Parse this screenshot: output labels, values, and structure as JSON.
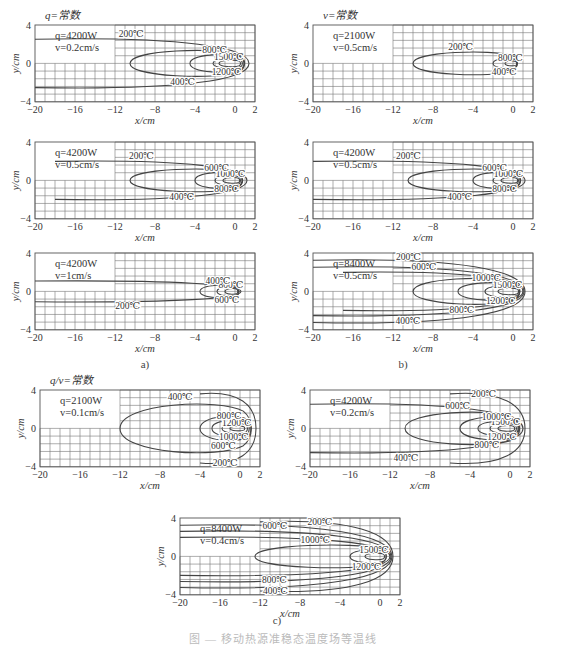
{
  "figure": {
    "sub_labels": {
      "a": "a)",
      "b": "b)",
      "c": "c)"
    },
    "caption": "图 — 移动热源准稳态温度场等温线",
    "group_titles": {
      "a": "q=常数",
      "b": "v=常数",
      "c": "q/v=常数"
    }
  },
  "axes_common": {
    "xlabel": "x/cm",
    "ylabel": "y/cm",
    "xticks": [
      -20,
      -16,
      -12,
      -8,
      -4,
      0,
      2
    ],
    "yticks": [
      4,
      0,
      -4
    ],
    "xlim": [
      -20,
      2
    ],
    "ylim": [
      -4,
      4
    ]
  },
  "chart_data": [
    {
      "id": "a1",
      "type": "line",
      "group": "a",
      "title": "q=常数",
      "params": {
        "q": "q=4200W",
        "v": "v=0.2cm/s"
      },
      "xlabel": "x/cm",
      "ylabel": "y/cm",
      "xlim": [
        -20,
        2
      ],
      "ylim": [
        -4,
        4
      ],
      "isotherms": [
        {
          "T": "1500℃",
          "x_min": -1.6,
          "x_max": 0.6,
          "half_width": 0.4
        },
        {
          "T": "1200℃",
          "x_min": -2.2,
          "x_max": 0.8,
          "half_width": 0.6
        },
        {
          "T": "800℃",
          "x_min": -4.5,
          "x_max": 1.0,
          "half_width": 1.1
        },
        {
          "T": "400℃",
          "x_min": -10.5,
          "x_max": 1.2,
          "half_width": 1.6
        },
        {
          "T": "200℃",
          "x_min": -20,
          "x_max": 1.4,
          "half_width": 2.8,
          "open": true
        }
      ],
      "annotations": [
        "1200℃",
        "1500℃",
        "800℃",
        "400℃",
        "200℃"
      ]
    },
    {
      "id": "a2",
      "type": "line",
      "group": "a",
      "params": {
        "q": "q=4200W",
        "v": "v=0.5cm/s"
      },
      "xlabel": "x/cm",
      "ylabel": "y/cm",
      "xlim": [
        -20,
        2
      ],
      "ylim": [
        -4,
        4
      ],
      "isotherms": [
        {
          "T": "1000℃",
          "x_min": -1.2,
          "x_max": 0.5,
          "half_width": 0.35
        },
        {
          "T": "800℃",
          "x_min": -2.0,
          "x_max": 0.6,
          "half_width": 0.6
        },
        {
          "T": "600℃",
          "x_min": -4.0,
          "x_max": 0.8,
          "half_width": 1.0
        },
        {
          "T": "400℃",
          "x_min": -10.5,
          "x_max": 1.0,
          "half_width": 1.4
        },
        {
          "T": "200℃",
          "x_min": -18,
          "x_max": 1.2,
          "half_width": 2.2,
          "open": true
        }
      ],
      "annotations": [
        "800℃",
        "1000℃",
        "400℃",
        "200℃",
        "600℃"
      ]
    },
    {
      "id": "a3",
      "type": "line",
      "group": "a",
      "params": {
        "q": "q=4200W",
        "v": "v=1cm/s"
      },
      "xlabel": "x/cm",
      "ylabel": "y/cm",
      "xlim": [
        -20,
        2
      ],
      "ylim": [
        -4,
        4
      ],
      "isotherms": [
        {
          "T": "800℃",
          "x_min": -1.0,
          "x_max": 0.3,
          "half_width": 0.35
        },
        {
          "T": "600℃",
          "x_min": -1.8,
          "x_max": 0.4,
          "half_width": 0.55
        },
        {
          "T": "400℃",
          "x_min": -3.5,
          "x_max": 0.5,
          "half_width": 0.8
        },
        {
          "T": "200℃",
          "x_min": -20,
          "x_max": 0.6,
          "half_width": 1.2,
          "open": true
        }
      ],
      "annotations": [
        "800℃",
        "600℃",
        "400℃",
        "200℃"
      ]
    },
    {
      "id": "b1",
      "type": "line",
      "group": "b",
      "title": "v=常数",
      "params": {
        "q": "q=2100W",
        "v": "v=0.5cm/s"
      },
      "xlabel": "x/cm",
      "ylabel": "y/cm",
      "xlim": [
        -20,
        2
      ],
      "ylim": [
        -4,
        4
      ],
      "isotherms": [
        {
          "T": "800℃",
          "x_min": -0.8,
          "x_max": 0.4,
          "half_width": 0.3
        },
        {
          "T": "400℃",
          "x_min": -2.0,
          "x_max": 0.5,
          "half_width": 0.6
        },
        {
          "T": "200℃",
          "x_min": -10.0,
          "x_max": 0.6,
          "half_width": 1.4
        }
      ],
      "annotations": [
        "400℃",
        "800℃",
        "200℃"
      ]
    },
    {
      "id": "b2",
      "type": "line",
      "group": "b",
      "params": {
        "q": "q=4200W",
        "v": "v=0.5cm/s"
      },
      "xlabel": "x/cm",
      "ylabel": "y/cm",
      "xlim": [
        -20,
        2
      ],
      "ylim": [
        -4,
        4
      ],
      "isotherms": [
        {
          "T": "1000℃",
          "x_min": -1.2,
          "x_max": 0.5,
          "half_width": 0.35
        },
        {
          "T": "800℃",
          "x_min": -2.0,
          "x_max": 0.6,
          "half_width": 0.6
        },
        {
          "T": "600℃",
          "x_min": -4.0,
          "x_max": 0.8,
          "half_width": 1.0
        },
        {
          "T": "400℃",
          "x_min": -10.5,
          "x_max": 1.0,
          "half_width": 1.4
        },
        {
          "T": "200℃",
          "x_min": -20,
          "x_max": 1.2,
          "half_width": 2.2,
          "open": true
        }
      ],
      "annotations": [
        "600℃",
        "800℃",
        "1000℃",
        "400℃",
        "200℃"
      ]
    },
    {
      "id": "b3",
      "type": "line",
      "group": "b",
      "params": {
        "q": "q=8400W",
        "v": "v=0.5cm/s"
      },
      "xlabel": "x/cm",
      "ylabel": "y/cm",
      "xlim": [
        -20,
        2
      ],
      "ylim": [
        -4,
        4
      ],
      "isotherms": [
        {
          "T": "1500℃",
          "x_min": -1.5,
          "x_max": 0.6,
          "half_width": 0.4
        },
        {
          "T": "1200℃",
          "x_min": -2.8,
          "x_max": 0.7,
          "half_width": 0.7
        },
        {
          "T": "1000℃",
          "x_min": -5.5,
          "x_max": 0.8,
          "half_width": 1.1
        },
        {
          "T": "800℃",
          "x_min": -10.0,
          "x_max": 0.9,
          "half_width": 1.6
        },
        {
          "T": "600℃",
          "x_min": -17.0,
          "x_max": 1.0,
          "half_width": 2.2,
          "open": true
        },
        {
          "T": "400℃",
          "x_min": -20,
          "x_max": 1.1,
          "half_width": 2.8,
          "open": true
        },
        {
          "T": "200℃",
          "x_min": -20,
          "x_max": 1.2,
          "half_width": 3.6,
          "open": true
        }
      ],
      "annotations": [
        "1000℃",
        "1200℃",
        "1500℃",
        "600℃",
        "800℃",
        "400℃",
        "200℃"
      ]
    },
    {
      "id": "c1",
      "type": "line",
      "group": "c",
      "title": "q/v=常数",
      "params": {
        "q": "q=2100W",
        "v": "v=0.1cm/s"
      },
      "xlabel": "x/cm",
      "ylabel": "y/cm",
      "xlim": [
        -20,
        2
      ],
      "ylim": [
        -4,
        4
      ],
      "isotherms": [
        {
          "T": "1200℃",
          "x_min": -1.0,
          "x_max": 0.5,
          "half_width": 0.3
        },
        {
          "T": "1000℃",
          "x_min": -1.8,
          "x_max": 0.8,
          "half_width": 0.6
        },
        {
          "T": "800℃",
          "x_min": -2.8,
          "x_max": 1.0,
          "half_width": 1.0
        },
        {
          "T": "600℃",
          "x_min": -4.0,
          "x_max": 1.2,
          "half_width": 1.5
        },
        {
          "T": "400℃",
          "x_min": -12.0,
          "x_max": 1.4,
          "half_width": 3.0
        },
        {
          "T": "200℃",
          "x_min": -4.0,
          "x_max": 1.6,
          "half_width": 4.0,
          "open": true
        }
      ],
      "annotations": [
        "800℃",
        "1000℃",
        "1200℃",
        "600℃",
        "400℃",
        "200℃"
      ]
    },
    {
      "id": "c2",
      "type": "line",
      "group": "c",
      "params": {
        "q": "q=4200W",
        "v": "v=0.2cm/s"
      },
      "xlabel": "x/cm",
      "ylabel": "y/cm",
      "xlim": [
        -20,
        2
      ],
      "ylim": [
        -4,
        4
      ],
      "isotherms": [
        {
          "T": "1500℃",
          "x_min": -1.2,
          "x_max": 0.5,
          "half_width": 0.35
        },
        {
          "T": "1200℃",
          "x_min": -2.0,
          "x_max": 0.7,
          "half_width": 0.6
        },
        {
          "T": "1000℃",
          "x_min": -3.2,
          "x_max": 0.9,
          "half_width": 0.9
        },
        {
          "T": "800℃",
          "x_min": -5.0,
          "x_max": 1.0,
          "half_width": 1.4
        },
        {
          "T": "600℃",
          "x_min": -10.5,
          "x_max": 1.2,
          "half_width": 2.0
        },
        {
          "T": "400℃",
          "x_min": -20,
          "x_max": 1.3,
          "half_width": 2.8,
          "open": true
        },
        {
          "T": "200℃",
          "x_min": -6.0,
          "x_max": 1.5,
          "half_width": 4.0,
          "open": true
        }
      ],
      "annotations": [
        "1000℃",
        "1200℃",
        "1500℃",
        "800℃",
        "600℃",
        "400℃",
        "200℃"
      ]
    },
    {
      "id": "c3",
      "type": "line",
      "group": "c",
      "params": {
        "q": "q=8400W",
        "v": "v=0.4cm/s"
      },
      "xlabel": "x/cm",
      "ylabel": "y/cm",
      "xlim": [
        -20,
        2
      ],
      "ylim": [
        -4,
        4
      ],
      "isotherms": [
        {
          "T": "1500℃",
          "x_min": -1.5,
          "x_max": 0.5,
          "half_width": 0.4
        },
        {
          "T": "1200℃",
          "x_min": -3.0,
          "x_max": 0.7,
          "half_width": 0.8
        },
        {
          "T": "1000℃",
          "x_min": -12.5,
          "x_max": 0.9,
          "half_width": 1.4
        },
        {
          "T": "800℃",
          "x_min": -20,
          "x_max": 1.0,
          "half_width": 2.2,
          "open": true
        },
        {
          "T": "600℃",
          "x_min": -20,
          "x_max": 1.1,
          "half_width": 2.9,
          "open": true
        },
        {
          "T": "400℃",
          "x_min": -20,
          "x_max": 1.2,
          "half_width": 3.6,
          "open": true
        },
        {
          "T": "200℃",
          "x_min": -12.0,
          "x_max": 1.3,
          "half_width": 4.0,
          "open": true
        }
      ],
      "annotations": [
        "1200℃",
        "1000℃",
        "600℃",
        "800℃",
        "1500℃",
        "400℃",
        "200℃"
      ]
    }
  ]
}
